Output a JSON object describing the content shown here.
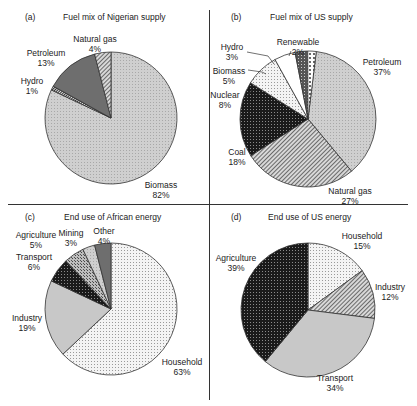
{
  "chart_data": [
    {
      "type": "pie",
      "panel": "(a)",
      "title": "Fuel mix of Nigerian supply",
      "categories": [
        "Biomass",
        "Hydro",
        "Petroleum",
        "Natural gas"
      ],
      "values": [
        82,
        1,
        13,
        4
      ],
      "unit": "%",
      "start_angle_deg": 0,
      "direction": "clockwise",
      "fills": [
        "light-dots",
        "hatch-dense",
        "dark-gray",
        "diagonal-hatch"
      ]
    },
    {
      "type": "pie",
      "panel": "(b)",
      "title": "Fuel mix of US supply",
      "categories": [
        "Petroleum",
        "Natural gas",
        "Coal",
        "Nuclear",
        "Biomass",
        "Hydro",
        "Renewable"
      ],
      "values": [
        37,
        27,
        18,
        8,
        5,
        3,
        2
      ],
      "unit": "%",
      "start_angle_deg": 7,
      "direction": "clockwise",
      "fills": [
        "light-dots",
        "diagonal-hatch",
        "black-grid",
        "sparse-dots",
        "white",
        "dark-crosshatch",
        "white-dots"
      ]
    },
    {
      "type": "pie",
      "panel": "(c)",
      "title": "End use of African energy",
      "categories": [
        "Household",
        "Industry",
        "Transport",
        "Agriculture",
        "Mining",
        "Other"
      ],
      "values": [
        63,
        19,
        6,
        5,
        3,
        4
      ],
      "unit": "%",
      "start_angle_deg": 0,
      "direction": "clockwise",
      "fills": [
        "sparse-dots",
        "light-gray",
        "black-grid",
        "crosshatch",
        "light-dots",
        "dark-gray"
      ]
    },
    {
      "type": "pie",
      "panel": "(d)",
      "title": "End use of US energy",
      "categories": [
        "Household",
        "Industry",
        "Transport",
        "Agriculture"
      ],
      "values": [
        15,
        12,
        34,
        39
      ],
      "unit": "%",
      "start_angle_deg": 0,
      "direction": "clockwise",
      "fills": [
        "sparse-dots",
        "diagonal-hatch",
        "light-gray",
        "black-grid"
      ]
    }
  ],
  "panels": {
    "a": {
      "tag": "(a)",
      "title": "Fuel mix of Nigerian supply",
      "labels": [
        {
          "name": "Natural gas",
          "pct": "4%"
        },
        {
          "name": "Petroleum",
          "pct": "13%"
        },
        {
          "name": "Hydro",
          "pct": "1%"
        },
        {
          "name": "Biomass",
          "pct": "82%"
        }
      ]
    },
    "b": {
      "tag": "(b)",
      "title": "Fuel mix of US supply",
      "labels": [
        {
          "name": "Hydro",
          "pct": "3%"
        },
        {
          "name": "Renewable",
          "pct": "2%"
        },
        {
          "name": "Biomass",
          "pct": "5%"
        },
        {
          "name": "Petroleum",
          "pct": "37%"
        },
        {
          "name": "Nuclear",
          "pct": "8%"
        },
        {
          "name": "Coal",
          "pct": "18%"
        },
        {
          "name": "Natural gas",
          "pct": "27%"
        }
      ]
    },
    "c": {
      "tag": "(c)",
      "title": "End use of African energy",
      "labels": [
        {
          "name": "Agriculture",
          "pct": "5%"
        },
        {
          "name": "Mining",
          "pct": "3%"
        },
        {
          "name": "Other",
          "pct": "4%"
        },
        {
          "name": "Transport",
          "pct": "6%"
        },
        {
          "name": "Industry",
          "pct": "19%"
        },
        {
          "name": "Household",
          "pct": "63%"
        }
      ]
    },
    "d": {
      "tag": "(d)",
      "title": "End use of US energy",
      "labels": [
        {
          "name": "Household",
          "pct": "15%"
        },
        {
          "name": "Agriculture",
          "pct": "39%"
        },
        {
          "name": "Industry",
          "pct": "12%"
        },
        {
          "name": "Transport",
          "pct": "34%"
        }
      ]
    }
  }
}
